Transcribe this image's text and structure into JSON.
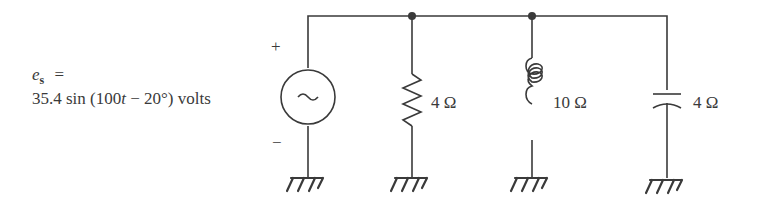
{
  "source": {
    "symbol": "e",
    "subscript": "s",
    "equals": "=",
    "expression": "35.4 sin (100t − 20°) volts",
    "expr_prefix": "35.4 sin (100",
    "expr_var": "t",
    "expr_suffix": " − 20°) volts",
    "plus": "+",
    "minus": "−",
    "glyph": "~"
  },
  "components": [
    {
      "type": "resistor",
      "label": "4 Ω"
    },
    {
      "type": "inductor",
      "label": "10 Ω"
    },
    {
      "type": "capacitor",
      "label": "4 Ω"
    }
  ],
  "colors": {
    "ink": "#3a3a3a",
    "background": "#ffffff"
  }
}
